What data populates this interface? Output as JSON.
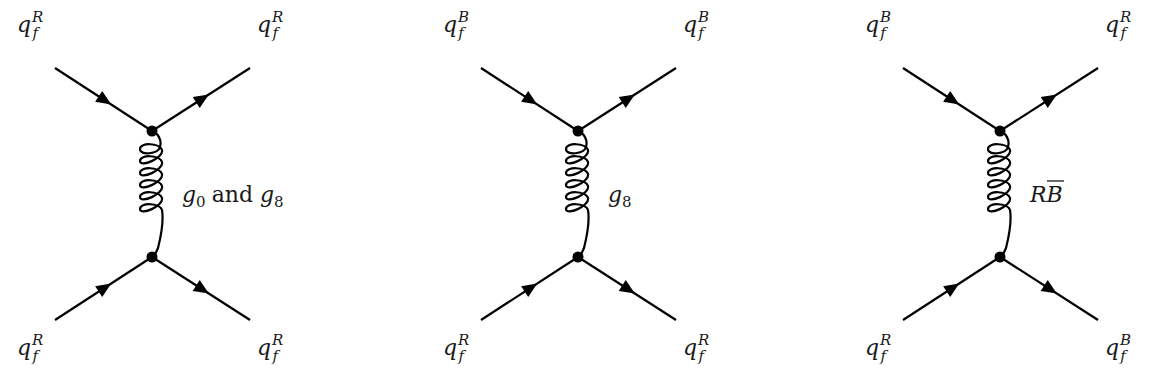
{
  "diagrams": [
    {
      "cx": 152,
      "labels": {
        "top_left": {
          "base": "q",
          "sub": "f",
          "sup": "R"
        },
        "top_right": {
          "base": "q",
          "sub": "f",
          "sup": "R"
        },
        "bottom_left": {
          "base": "q",
          "sub": "f",
          "sup": "R"
        },
        "bottom_right": {
          "base": "q",
          "sub": "f",
          "sup": "R"
        }
      },
      "propagator": {
        "g1": "g",
        "g1_sub": "0",
        "and": "and",
        "g2": "g",
        "g2_sub": "8"
      }
    },
    {
      "cx": 578,
      "labels": {
        "top_left": {
          "base": "q",
          "sub": "f",
          "sup": "B"
        },
        "top_right": {
          "base": "q",
          "sub": "f",
          "sup": "B"
        },
        "bottom_left": {
          "base": "q",
          "sub": "f",
          "sup": "R"
        },
        "bottom_right": {
          "base": "q",
          "sub": "f",
          "sup": "R"
        }
      },
      "propagator": {
        "g": "g",
        "g_sub": "8"
      }
    },
    {
      "cx": 1000,
      "labels": {
        "top_left": {
          "base": "q",
          "sub": "f",
          "sup": "B"
        },
        "top_right": {
          "base": "q",
          "sub": "f",
          "sup": "R"
        },
        "bottom_left": {
          "base": "q",
          "sub": "f",
          "sup": "R"
        },
        "bottom_right": {
          "base": "q",
          "sub": "f",
          "sup": "B"
        }
      },
      "propagator": {
        "c1": "R",
        "c2": "B",
        "c2_overline": true
      }
    }
  ],
  "colors": {
    "ink": "#000000",
    "background": "#ffffff"
  }
}
